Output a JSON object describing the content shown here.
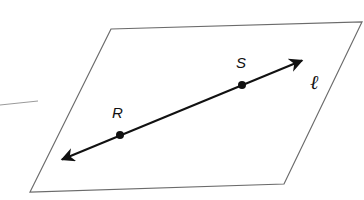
{
  "diagram": {
    "plane": {
      "corners": [
        [
          111,
          29
        ],
        [
          362,
          22
        ],
        [
          284,
          184
        ],
        [
          30,
          192
        ]
      ],
      "stroke": "#6b6b6b"
    },
    "line": {
      "name": "ℓ",
      "from": [
        56,
        162
      ],
      "to": [
        308,
        58
      ],
      "stroke": "#111111"
    },
    "points": [
      {
        "label": "R",
        "x": 120,
        "y": 135
      },
      {
        "label": "S",
        "x": 242,
        "y": 85
      }
    ],
    "line_label": "ℓ"
  }
}
